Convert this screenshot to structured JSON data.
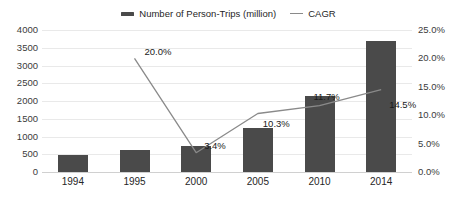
{
  "chart_data": {
    "type": "bar",
    "title": "",
    "subtitle": "",
    "xlabel": "",
    "ylabel": "",
    "grid": true,
    "legend_position": "top-center",
    "categories": [
      "1994",
      "1995",
      "2000",
      "2005",
      "2010",
      "2014"
    ],
    "series": [
      {
        "name": "Number of Person-Trips (million)",
        "type": "bar",
        "axis": "left",
        "color": "#4a4a4a",
        "values": [
          490,
          620,
          740,
          1240,
          2140,
          3680
        ]
      },
      {
        "name": "CAGR",
        "type": "line",
        "axis": "right",
        "color": "#8a8a8a",
        "values": [
          null,
          20.0,
          3.4,
          10.3,
          11.7,
          14.5
        ],
        "point_labels": [
          "",
          "20.0%",
          "3.4%",
          "10.3%",
          "11.7%",
          "14.5%"
        ]
      }
    ],
    "left_axis": {
      "min": 0,
      "max": 4000,
      "step": 500,
      "ticks": [
        "0",
        "500",
        "1000",
        "1500",
        "2000",
        "2500",
        "3000",
        "3500",
        "4000"
      ],
      "tick_values": [
        0,
        500,
        1000,
        1500,
        2000,
        2500,
        3000,
        3500,
        4000
      ]
    },
    "right_axis": {
      "min": 0,
      "max": 25,
      "step": 5,
      "ticks": [
        "0.0%",
        "5.0%",
        "10.0%",
        "15.0%",
        "20.0%",
        "25.0%"
      ],
      "tick_values": [
        0,
        5,
        10,
        15,
        20,
        25
      ]
    }
  },
  "legend": {
    "entries": [
      {
        "label": "Number of Person-Trips (million)",
        "marker": "bar-swatch",
        "color": "#4a4a4a"
      },
      {
        "label": "CAGR",
        "marker": "line-swatch",
        "color": "#8a8a8a"
      }
    ]
  }
}
